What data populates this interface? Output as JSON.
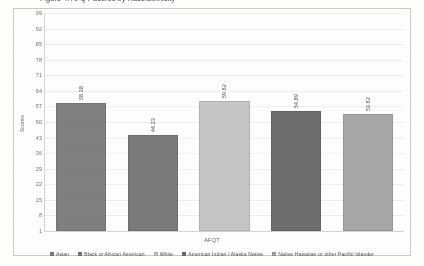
{
  "title_clipped": "Figure 4.  AFQT Scores by Race/Ethnicity",
  "axis": {
    "y_title": "Scores",
    "x_title": "AFQT"
  },
  "chart_data": {
    "type": "bar",
    "title": "Figure 4.  AFQT Scores by Race/Ethnicity",
    "xlabel": "AFQT",
    "ylabel": "Scores",
    "categories": [
      "AFQT"
    ],
    "ylim": [
      1,
      99
    ],
    "yticks": [
      1,
      8,
      15,
      22,
      29,
      36,
      43,
      50,
      57,
      64,
      71,
      78,
      85,
      92,
      99
    ],
    "grid": true,
    "legend_position": "bottom",
    "series": [
      {
        "name": "Asian",
        "values": [
          58.38
        ],
        "label": "58.38",
        "color": "#808080"
      },
      {
        "name": "Black or African American",
        "values": [
          44.23
        ],
        "label": "44.23",
        "color": "#7b7b7b"
      },
      {
        "name": "White",
        "values": [
          59.62
        ],
        "label": "59.62",
        "color": "#c6c6c6"
      },
      {
        "name": "American Indian / Alaska Native",
        "values": [
          54.89
        ],
        "label": "54.89",
        "color": "#6e6e6e"
      },
      {
        "name": "Native Hawaiian or other Pacific Islander",
        "values": [
          53.62
        ],
        "label": "53.62",
        "color": "#a8a8a8"
      }
    ]
  }
}
